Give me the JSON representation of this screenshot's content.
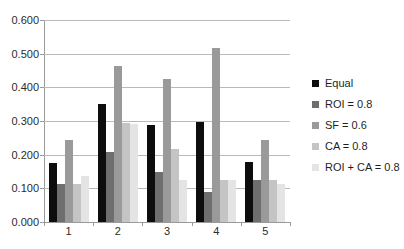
{
  "chart_data": {
    "type": "bar",
    "title": "",
    "subtitle": "",
    "xlabel": "",
    "ylabel": "",
    "categories": [
      "1",
      "2",
      "3",
      "4",
      "5"
    ],
    "ylim": [
      0.0,
      0.6
    ],
    "ytick_labels": [
      "0.000",
      "0.100",
      "0.200",
      "0.300",
      "0.400",
      "0.500",
      "0.600"
    ],
    "ytick_values": [
      0.0,
      0.1,
      0.2,
      0.3,
      0.4,
      0.5,
      0.6
    ],
    "grid": "horizontal",
    "legend_position": "right",
    "series": [
      {
        "name": "Equal",
        "color": "#0d0d0d",
        "values": [
          0.175,
          0.35,
          0.289,
          0.296,
          0.178
        ]
      },
      {
        "name": "ROI = 0.8",
        "color": "#6e6e6e",
        "values": [
          0.113,
          0.208,
          0.148,
          0.09,
          0.125
        ]
      },
      {
        "name": "SF = 0.6",
        "color": "#9a9a9a",
        "values": [
          0.245,
          0.462,
          0.425,
          0.517,
          0.245
        ]
      },
      {
        "name": "CA = 0.8",
        "color": "#c4c4c4",
        "values": [
          0.113,
          0.293,
          0.218,
          0.125,
          0.125
        ]
      },
      {
        "name": "ROI + CA = 0.8",
        "color": "#e4e4e4",
        "values": [
          0.138,
          0.29,
          0.125,
          0.125,
          0.113
        ]
      }
    ]
  }
}
